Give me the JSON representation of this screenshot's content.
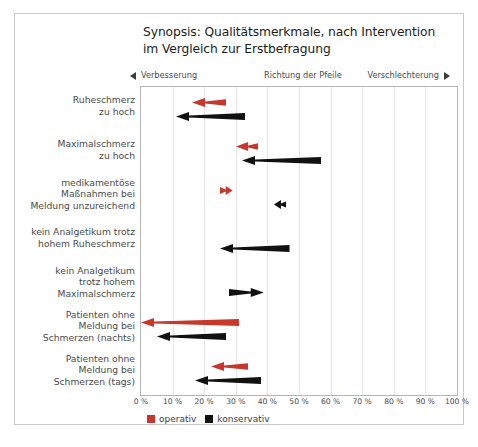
{
  "chart_data": {
    "type": "bar",
    "title": "Synopsis: Qualitätsmerkmale, nach Intervention im Vergleich zur Erstbefragung",
    "title_line1": "Synopsis: Qualitätsmerkmale, nach Intervention",
    "title_line2": "im Vergleich zur Erstbefragung",
    "xlabel": "",
    "ylabel": "",
    "xlim": [
      0,
      100
    ],
    "grid": true,
    "legend_position": "bottom-left",
    "direction_band": {
      "left_label": "Verbesserung",
      "left_marker": "triangle-left",
      "center_label": "Richtung der Pfeile",
      "right_label": "Verschlechterung",
      "right_marker": "triangle-right"
    },
    "xticks": [
      "0 %",
      "10 %",
      "20 %",
      "30 %",
      "40 %",
      "50 %",
      "60 %",
      "70 %",
      "80 %",
      "90 %",
      "100 %"
    ],
    "xtick_values": [
      0,
      10,
      20,
      30,
      40,
      50,
      60,
      70,
      80,
      90,
      100
    ],
    "colors": {
      "operativ": "#c8372b",
      "konservativ": "#111111",
      "grid": "#e6e6e6",
      "axis": "#b4b4b4",
      "text": "#4a4a4a",
      "title": "#1d1d1b",
      "frame": "#c9c9c9"
    },
    "series": [
      {
        "name": "operativ",
        "color": "#c8372b"
      },
      {
        "name": "konservativ",
        "color": "#111111"
      }
    ],
    "categories": [
      {
        "label_lines": [
          "Ruheschmerz",
          "zu hoch"
        ]
      },
      {
        "label_lines": [
          "Maximalschmerz",
          "zu hoch"
        ]
      },
      {
        "label_lines": [
          "medikamentöse",
          "Maßnahmen bei",
          "Meldung unzureichend"
        ]
      },
      {
        "label_lines": [
          "kein Analgetikum trotz",
          "hohem Ruheschmerz"
        ]
      },
      {
        "label_lines": [
          "kein Analgetikum",
          "trotz hohem",
          "Maximalschmerz"
        ]
      },
      {
        "label_lines": [
          "Patienten ohne",
          "Meldung bei",
          "Schmerzen (nachts)"
        ]
      },
      {
        "label_lines": [
          "Patienten ohne",
          "Meldung bei",
          "Schmerzen (tags)"
        ]
      }
    ],
    "arrows": [
      {
        "category": "Ruheschmerz zu hoch",
        "series": "operativ",
        "from": 27,
        "to": 16,
        "direction": "left"
      },
      {
        "category": "Ruheschmerz zu hoch",
        "series": "konservativ",
        "from": 33,
        "to": 11,
        "direction": "left"
      },
      {
        "category": "Maximalschmerz zu hoch",
        "series": "operativ",
        "from": 37,
        "to": 30,
        "direction": "left"
      },
      {
        "category": "Maximalschmerz zu hoch",
        "series": "konservativ",
        "from": 57,
        "to": 32,
        "direction": "left"
      },
      {
        "category": "medikamentöse Maßnahmen bei Meldung unzureichend",
        "series": "operativ",
        "from": 25,
        "to": 29,
        "direction": "right"
      },
      {
        "category": "medikamentöse Maßnahmen bei Meldung unzureichend",
        "series": "konservativ",
        "from": 46,
        "to": 42,
        "direction": "left"
      },
      {
        "category": "kein Analgetikum trotz hohem Ruheschmerz",
        "series": "konservativ",
        "from": 47,
        "to": 25,
        "direction": "left"
      },
      {
        "category": "kein Analgetikum trotz hohem Maximalschmerz",
        "series": "konservativ",
        "from": 28,
        "to": 39,
        "direction": "right"
      },
      {
        "category": "Patienten ohne Meldung bei Schmerzen (nachts)",
        "series": "operativ",
        "from": 31,
        "to": 0,
        "direction": "left"
      },
      {
        "category": "Patienten ohne Meldung bei Schmerzen (nachts)",
        "series": "konservativ",
        "from": 27,
        "to": 5,
        "direction": "left"
      },
      {
        "category": "Patienten ohne Meldung bei Schmerzen (tags)",
        "series": "operativ",
        "from": 34,
        "to": 22,
        "direction": "left"
      },
      {
        "category": "Patienten ohne Meldung bei Schmerzen (tags)",
        "series": "konservativ",
        "from": 38,
        "to": 17,
        "direction": "left"
      }
    ],
    "legend": [
      {
        "label": "operativ",
        "color": "#c8372b"
      },
      {
        "label": "konservativ",
        "color": "#111111"
      }
    ]
  }
}
